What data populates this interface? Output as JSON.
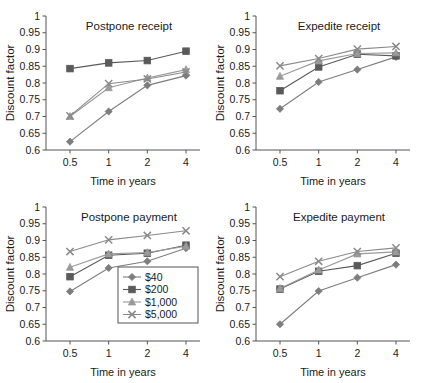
{
  "figure": {
    "marker_shapes": [
      "diamond",
      "square",
      "triangle",
      "cross"
    ],
    "series_names": [
      "$40",
      "$200",
      "$1,000",
      "$5,000"
    ],
    "series_colors": [
      "#7d7d7d",
      "#5a5a5a",
      "#9a9a9a",
      "#8a8a8a"
    ],
    "axis_color": "#555555",
    "background": "#ffffff"
  },
  "legend": {
    "location": "bottom-left-panel",
    "items": [
      {
        "label": "$40",
        "marker": "diamond"
      },
      {
        "label": "$200",
        "marker": "square"
      },
      {
        "label": "$1,000",
        "marker": "triangle"
      },
      {
        "label": "$5,000",
        "marker": "cross"
      }
    ]
  },
  "chart_data": [
    {
      "type": "line",
      "title": "Postpone receipt",
      "xlabel": "Time in years",
      "ylabel": "Discount factor",
      "categories": [
        "0.5",
        "1",
        "2",
        "4"
      ],
      "ylim": [
        0.6,
        1
      ],
      "yticks": [
        "0.6",
        "0.65",
        "0.7",
        "0.75",
        "0.8",
        "0.85",
        "0.9",
        "0.95",
        "1"
      ],
      "grid": false,
      "series": [
        {
          "name": "$40",
          "marker": "diamond",
          "values": [
            0.625,
            0.715,
            0.793,
            0.822
          ]
        },
        {
          "name": "$200",
          "marker": "square",
          "values": [
            0.843,
            0.86,
            0.867,
            0.895
          ]
        },
        {
          "name": "$1,000",
          "marker": "triangle",
          "values": [
            0.7,
            0.786,
            0.815,
            0.84
          ]
        },
        {
          "name": "$5,000",
          "marker": "cross",
          "values": [
            0.702,
            0.798,
            0.812,
            0.833
          ]
        }
      ]
    },
    {
      "type": "line",
      "title": "Expedite receipt",
      "xlabel": "Time in years",
      "ylabel": "Discount factor",
      "categories": [
        "0.5",
        "1",
        "2",
        "4"
      ],
      "ylim": [
        0.6,
        1
      ],
      "yticks": [
        "0.6",
        "0.65",
        "0.7",
        "0.75",
        "0.8",
        "0.85",
        "0.9",
        "0.95",
        "1"
      ],
      "grid": false,
      "series": [
        {
          "name": "$40",
          "marker": "diamond",
          "values": [
            0.723,
            0.803,
            0.84,
            0.878
          ]
        },
        {
          "name": "$200",
          "marker": "square",
          "values": [
            0.777,
            0.848,
            0.886,
            0.881
          ]
        },
        {
          "name": "$1,000",
          "marker": "triangle",
          "values": [
            0.82,
            0.866,
            0.888,
            0.89
          ]
        },
        {
          "name": "$5,000",
          "marker": "cross",
          "values": [
            0.851,
            0.873,
            0.901,
            0.909
          ]
        }
      ]
    },
    {
      "type": "line",
      "title": "Postpone payment",
      "xlabel": "Time in years",
      "ylabel": "Discount factor",
      "categories": [
        "0.5",
        "1",
        "2",
        "4"
      ],
      "ylim": [
        0.6,
        1
      ],
      "yticks": [
        "0.6",
        "0.65",
        "0.7",
        "0.75",
        "0.8",
        "0.85",
        "0.9",
        "0.95",
        "1"
      ],
      "grid": false,
      "series": [
        {
          "name": "$40",
          "marker": "diamond",
          "values": [
            0.748,
            0.818,
            0.838,
            0.877
          ]
        },
        {
          "name": "$200",
          "marker": "square",
          "values": [
            0.792,
            0.856,
            0.862,
            0.886
          ]
        },
        {
          "name": "$1,000",
          "marker": "triangle",
          "values": [
            0.82,
            0.86,
            0.864,
            0.883
          ]
        },
        {
          "name": "$5,000",
          "marker": "cross",
          "values": [
            0.867,
            0.902,
            0.915,
            0.929
          ]
        }
      ]
    },
    {
      "type": "line",
      "title": "Expedite payment",
      "xlabel": "Time in years",
      "ylabel": "Discount factor",
      "categories": [
        "0.5",
        "1",
        "2",
        "4"
      ],
      "ylim": [
        0.6,
        1
      ],
      "yticks": [
        "0.6",
        "0.65",
        "0.7",
        "0.75",
        "0.8",
        "0.85",
        "0.9",
        "0.95",
        "1"
      ],
      "grid": false,
      "series": [
        {
          "name": "$40",
          "marker": "diamond",
          "values": [
            0.65,
            0.749,
            0.789,
            0.828
          ]
        },
        {
          "name": "$200",
          "marker": "square",
          "values": [
            0.755,
            0.808,
            0.825,
            0.862
          ]
        },
        {
          "name": "$1,000",
          "marker": "triangle",
          "values": [
            0.757,
            0.812,
            0.86,
            0.866
          ]
        },
        {
          "name": "$5,000",
          "marker": "cross",
          "values": [
            0.792,
            0.838,
            0.867,
            0.878
          ]
        }
      ]
    }
  ]
}
